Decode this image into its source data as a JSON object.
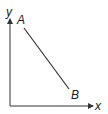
{
  "diagram": {
    "axes": {
      "x_label": "x",
      "y_label": "y",
      "color": "#333333"
    },
    "segment": {
      "start_label": "A",
      "end_label": "B",
      "color": "#333333"
    }
  }
}
